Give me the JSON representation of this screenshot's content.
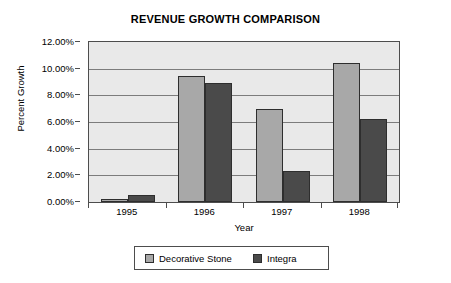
{
  "chart_data": {
    "type": "bar",
    "title": "REVENUE GROWTH COMPARISON",
    "xlabel": "Year",
    "ylabel": "Percent Growth",
    "categories": [
      "1995",
      "1996",
      "1997",
      "1998"
    ],
    "series": [
      {
        "name": "Decorative Stone",
        "color": "#a8a8a8",
        "values": [
          0.25,
          9.45,
          6.95,
          10.4
        ]
      },
      {
        "name": "Integra",
        "color": "#4a4a4a",
        "values": [
          0.55,
          8.9,
          2.3,
          6.2
        ]
      }
    ],
    "ylim": [
      0,
      12
    ],
    "ytick_values": [
      0,
      2,
      4,
      6,
      8,
      10,
      12
    ],
    "ytick_labels": [
      "0.00%",
      "2.00%",
      "4.00%",
      "6.00%",
      "8.00%",
      "10.00%",
      "12.00%"
    ],
    "grid": true,
    "legend_position": "bottom",
    "plot_background": "#e9e9e9",
    "axis_color": "#4d4d4d",
    "gridline_color": "#7c7c7c"
  },
  "legend": {
    "entries": [
      {
        "label": "Decorative Stone",
        "color": "#a8a8a8"
      },
      {
        "label": "Integra",
        "color": "#4a4a4a"
      }
    ]
  }
}
